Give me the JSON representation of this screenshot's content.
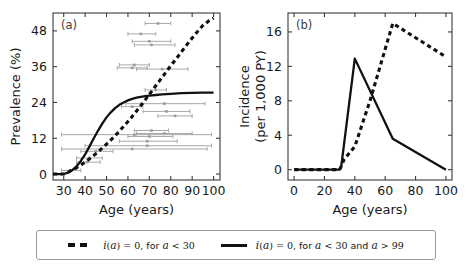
{
  "figure": {
    "panel_a_tag": "(a)",
    "panel_b_tag": "(b)"
  },
  "legend": {
    "entries": [
      {
        "style": "dashed",
        "name": "legend-dashed",
        "parts": {
          "func": "i(a)",
          "eq": "= 0, for ",
          "var1": "a",
          "rel1": "< 30",
          "tail": ""
        },
        "full_text": "i(a) = 0, for a < 30"
      },
      {
        "style": "solid",
        "name": "legend-solid",
        "parts": {
          "func": "i(a)",
          "eq": "= 0, for ",
          "var1": "a",
          "rel1": "< 30",
          "tail": " and a > 99"
        },
        "full_text": "i(a) = 0, for a < 30 and a > 99"
      }
    ]
  },
  "chart_data": [
    {
      "type": "line",
      "panel": "(a)",
      "title": "",
      "xlabel": "Age (years)",
      "ylabel": "Prevalence (%)",
      "xlim": [
        25,
        103
      ],
      "ylim": [
        -2,
        54
      ],
      "xticks": [
        30,
        40,
        50,
        60,
        70,
        80,
        90,
        100
      ],
      "yticks": [
        0,
        12,
        24,
        36,
        48
      ],
      "grid": false,
      "legend_position": "below-figure",
      "series": [
        {
          "name": "i(a) = 0, for a < 30",
          "style": "dashed",
          "color": "#111111",
          "x": [
            25,
            30,
            32,
            35,
            38,
            40,
            43,
            45,
            48,
            50,
            53,
            55,
            58,
            60,
            63,
            65,
            68,
            70,
            73,
            75,
            78,
            80,
            83,
            85,
            88,
            90,
            93,
            95,
            98,
            100
          ],
          "y": [
            0,
            0,
            0.6,
            1.7,
            3.0,
            4.0,
            5.6,
            6.8,
            8.7,
            10.0,
            12.1,
            13.6,
            16.0,
            17.6,
            20.2,
            22.0,
            24.8,
            26.7,
            29.6,
            31.5,
            34.4,
            36.3,
            39.1,
            41.0,
            43.8,
            45.6,
            48.2,
            49.8,
            51.5,
            52.3
          ]
        },
        {
          "name": "i(a) = 0, for a < 30 and a > 99",
          "style": "solid",
          "color": "#111111",
          "x": [
            25,
            30,
            32,
            34,
            36,
            38,
            40,
            42,
            44,
            46,
            48,
            50,
            52,
            54,
            56,
            58,
            60,
            62,
            64,
            66,
            68,
            70,
            73,
            76,
            80,
            85,
            90,
            95,
            100
          ],
          "y": [
            0,
            0,
            0.5,
            1.3,
            2.6,
            4.4,
            6.6,
            9.2,
            11.9,
            14.5,
            16.9,
            19.0,
            20.7,
            22.1,
            23.2,
            24.0,
            24.7,
            25.2,
            25.6,
            25.9,
            26.1,
            26.3,
            26.5,
            26.7,
            26.9,
            27.1,
            27.2,
            27.3,
            27.3
          ]
        }
      ],
      "error_bars": {
        "description": "grey horizontal study intervals with point markers",
        "color": "#a8a8a8",
        "items": [
          {
            "y": 50.5,
            "x_center": 74,
            "x_low": 68,
            "x_high": 80
          },
          {
            "y": 47.0,
            "x_center": 66,
            "x_low": 60,
            "x_high": 73
          },
          {
            "y": 44.5,
            "x_center": 70,
            "x_low": 62,
            "x_high": 80
          },
          {
            "y": 43.3,
            "x_center": 71,
            "x_low": 63,
            "x_high": 82
          },
          {
            "y": 36.6,
            "x_center": 63,
            "x_low": 56,
            "x_high": 70
          },
          {
            "y": 35.6,
            "x_center": 62,
            "x_low": 55,
            "x_high": 69
          },
          {
            "y": 35.2,
            "x_center": 76,
            "x_low": 64,
            "x_high": 88
          },
          {
            "y": 28.2,
            "x_center": 73,
            "x_low": 68,
            "x_high": 78
          },
          {
            "y": 23.6,
            "x_center": 77,
            "x_low": 59,
            "x_high": 96
          },
          {
            "y": 22.6,
            "x_center": 62,
            "x_low": 57,
            "x_high": 67
          },
          {
            "y": 21.0,
            "x_center": 78,
            "x_low": 67,
            "x_high": 89
          },
          {
            "y": 19.5,
            "x_center": 82,
            "x_low": 74,
            "x_high": 90
          },
          {
            "y": 14.6,
            "x_center": 71,
            "x_low": 63,
            "x_high": 79
          },
          {
            "y": 13.6,
            "x_center": 77,
            "x_low": 64,
            "x_high": 90
          },
          {
            "y": 13.2,
            "x_center": 63,
            "x_low": 29,
            "x_high": 99
          },
          {
            "y": 12.6,
            "x_center": 70,
            "x_low": 60,
            "x_high": 81
          },
          {
            "y": 11.0,
            "x_center": 69,
            "x_low": 56,
            "x_high": 83
          },
          {
            "y": 9.5,
            "x_center": 69,
            "x_low": 40,
            "x_high": 99
          },
          {
            "y": 8.4,
            "x_center": 62,
            "x_low": 29,
            "x_high": 97
          },
          {
            "y": 7.6,
            "x_center": 45,
            "x_low": 38,
            "x_high": 53
          },
          {
            "y": 5.4,
            "x_center": 42,
            "x_low": 36,
            "x_high": 48
          },
          {
            "y": 4.0,
            "x_center": 41,
            "x_low": 36,
            "x_high": 47
          },
          {
            "y": 1.2,
            "x_center": 33,
            "x_low": 29,
            "x_high": 38
          }
        ]
      }
    },
    {
      "type": "line",
      "panel": "(b)",
      "title": "",
      "xlabel": "Age (years)",
      "ylabel": "Incidence (per 1,000 PY)",
      "ylabel_line1": "Incidence",
      "ylabel_line2": "(per 1,000 PY)",
      "xlim": [
        -4,
        104
      ],
      "ylim": [
        -1.2,
        18.2
      ],
      "xticks": [
        0,
        20,
        40,
        60,
        80,
        100
      ],
      "yticks": [
        0,
        4,
        8,
        12,
        16
      ],
      "grid": false,
      "legend_position": "below-figure",
      "series": [
        {
          "name": "i(a) = 0, for a < 30",
          "style": "dashed",
          "color": "#111111",
          "x": [
            0,
            30,
            33,
            40,
            50,
            65,
            100
          ],
          "y": [
            0,
            0,
            1.2,
            2.7,
            8.0,
            17.0,
            13.1
          ]
        },
        {
          "name": "i(a) = 0, for a < 30 and a > 99",
          "style": "solid",
          "color": "#111111",
          "x": [
            0,
            30,
            31,
            40,
            65,
            100
          ],
          "y": [
            0,
            0,
            0.3,
            12.9,
            3.6,
            0.0
          ]
        }
      ]
    }
  ]
}
